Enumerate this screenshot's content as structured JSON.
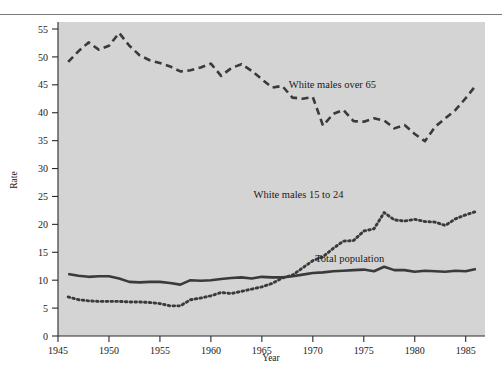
{
  "chart_data": {
    "type": "line",
    "title": "",
    "xlabel": "Year",
    "ylabel": "Rate",
    "xlim": [
      1945,
      1986.5
    ],
    "ylim": [
      0,
      57
    ],
    "grid": false,
    "legend_position": "inline-annotations",
    "xticks": [
      1945,
      1950,
      1955,
      1960,
      1965,
      1970,
      1975,
      1980,
      1985
    ],
    "xtick_labels": [
      "1945",
      "1950",
      "1955",
      "1960",
      "1965",
      "1970",
      "1975",
      "1980",
      "1985"
    ],
    "yticks": [
      0,
      5,
      10,
      15,
      20,
      25,
      30,
      35,
      40,
      45,
      50,
      55
    ],
    "ytick_labels": [
      "0",
      "5",
      "10",
      "15",
      "20",
      "25",
      "30",
      "35",
      "40",
      "45",
      "50",
      "55"
    ],
    "plot_background": "#d4d4d4",
    "line_color": "#3a3a3a",
    "series": [
      {
        "name": "White males over 65",
        "style": "dashed",
        "label_x": 1976.2,
        "label_y": 44.5,
        "x": [
          1946,
          1947,
          1948,
          1949,
          1950,
          1951,
          1952,
          1953,
          1954,
          1955,
          1956,
          1957,
          1958,
          1959,
          1960,
          1961,
          1962,
          1963,
          1964,
          1965,
          1966,
          1967,
          1968,
          1969,
          1970,
          1971,
          1972,
          1973,
          1974,
          1975,
          1976,
          1977,
          1978,
          1979,
          1980,
          1981,
          1982,
          1983,
          1984,
          1985,
          1986
        ],
        "values": [
          49.1,
          51.0,
          52.6,
          51.3,
          52.0,
          54.3,
          52.0,
          50.3,
          49.4,
          48.9,
          48.3,
          47.4,
          47.6,
          48.1,
          48.8,
          46.6,
          48.0,
          48.7,
          47.5,
          46.0,
          44.5,
          44.8,
          42.7,
          42.5,
          42.8,
          37.7,
          39.8,
          40.5,
          38.5,
          38.4,
          39.0,
          38.6,
          37.2,
          37.8,
          36.2,
          34.9,
          37.5,
          39.0,
          40.5,
          42.6,
          44.9
        ]
      },
      {
        "name": "White males 15 to 24",
        "style": "dotted",
        "label_x": 1973.0,
        "label_y": 24.8,
        "x": [
          1946,
          1947,
          1948,
          1949,
          1950,
          1951,
          1952,
          1953,
          1954,
          1955,
          1956,
          1957,
          1958,
          1959,
          1960,
          1961,
          1962,
          1963,
          1964,
          1965,
          1966,
          1967,
          1968,
          1969,
          1970,
          1971,
          1972,
          1973,
          1974,
          1975,
          1976,
          1977,
          1978,
          1979,
          1980,
          1981,
          1982,
          1983,
          1984,
          1985,
          1986
        ],
        "values": [
          7.0,
          6.5,
          6.3,
          6.2,
          6.2,
          6.2,
          6.1,
          6.1,
          6.0,
          5.8,
          5.4,
          5.4,
          6.5,
          6.8,
          7.2,
          7.8,
          7.6,
          8.0,
          8.4,
          8.8,
          9.4,
          10.4,
          10.9,
          12.2,
          13.5,
          14.2,
          15.7,
          17.0,
          17.1,
          18.8,
          19.2,
          22.1,
          20.8,
          20.6,
          20.9,
          20.5,
          20.4,
          19.8,
          21.0,
          21.7,
          22.3
        ]
      },
      {
        "name": "Total population",
        "style": "solid",
        "label_x": 1977.0,
        "label_y": 13.3,
        "x": [
          1946,
          1947,
          1948,
          1949,
          1950,
          1951,
          1952,
          1953,
          1954,
          1955,
          1956,
          1957,
          1958,
          1959,
          1960,
          1961,
          1962,
          1963,
          1964,
          1965,
          1966,
          1967,
          1968,
          1969,
          1970,
          1971,
          1972,
          1973,
          1974,
          1975,
          1976,
          1977,
          1978,
          1979,
          1980,
          1981,
          1982,
          1983,
          1984,
          1985,
          1986
        ],
        "values": [
          11.1,
          10.8,
          10.6,
          10.7,
          10.7,
          10.3,
          9.7,
          9.6,
          9.7,
          9.7,
          9.5,
          9.2,
          10.0,
          9.9,
          10.0,
          10.2,
          10.4,
          10.5,
          10.3,
          10.6,
          10.5,
          10.5,
          10.7,
          11.0,
          11.3,
          11.4,
          11.6,
          11.7,
          11.8,
          11.9,
          11.6,
          12.4,
          11.8,
          11.8,
          11.5,
          11.7,
          11.6,
          11.5,
          11.7,
          11.6,
          12.0
        ]
      }
    ]
  },
  "annotations": {
    "series_over65": "White males over 65",
    "series_15to24": "White males 15 to 24",
    "series_total": "Total population"
  }
}
